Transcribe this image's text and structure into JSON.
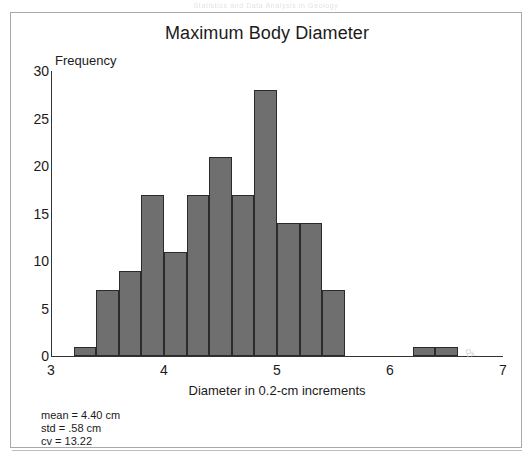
{
  "scan_header": "Statistics and Data Analysis in Geology",
  "chart_data": {
    "type": "bar",
    "title": "Maximum Body Diameter",
    "xlabel": "Diameter in 0.2-cm increments",
    "ylabel": "Frequency",
    "xlim": [
      3,
      7
    ],
    "ylim": [
      0,
      30
    ],
    "grid": false,
    "legend": null,
    "bin_width": 0.2,
    "xticks": [
      "3",
      "4",
      "5",
      "6",
      "7"
    ],
    "xtick_values": [
      3,
      4,
      5,
      6,
      7
    ],
    "yticks": [
      "0",
      "5",
      "10",
      "15",
      "20",
      "25",
      "30"
    ],
    "ytick_values": [
      0,
      5,
      10,
      15,
      20,
      25,
      30
    ],
    "bins": [
      {
        "x0": 3.2,
        "x1": 3.4,
        "value": 1
      },
      {
        "x0": 3.4,
        "x1": 3.6,
        "value": 7
      },
      {
        "x0": 3.6,
        "x1": 3.8,
        "value": 9
      },
      {
        "x0": 3.8,
        "x1": 4.0,
        "value": 17
      },
      {
        "x0": 4.0,
        "x1": 4.2,
        "value": 11
      },
      {
        "x0": 4.2,
        "x1": 4.4,
        "value": 17
      },
      {
        "x0": 4.4,
        "x1": 4.6,
        "value": 21
      },
      {
        "x0": 4.6,
        "x1": 4.8,
        "value": 17
      },
      {
        "x0": 4.8,
        "x1": 5.0,
        "value": 28
      },
      {
        "x0": 5.0,
        "x1": 5.2,
        "value": 14
      },
      {
        "x0": 5.2,
        "x1": 5.4,
        "value": 14
      },
      {
        "x0": 5.4,
        "x1": 5.6,
        "value": 7
      },
      {
        "x0": 6.2,
        "x1": 6.4,
        "value": 1
      },
      {
        "x0": 6.4,
        "x1": 6.6,
        "value": 1
      }
    ],
    "categories": [
      "3.2",
      "3.4",
      "3.6",
      "3.8",
      "4.0",
      "4.2",
      "4.4",
      "4.6",
      "4.8",
      "5.0",
      "5.2",
      "5.4",
      "6.2",
      "6.4"
    ],
    "values": [
      1,
      7,
      9,
      17,
      11,
      17,
      21,
      17,
      28,
      14,
      14,
      7,
      1,
      1
    ],
    "bar_color": "#6f6f6f",
    "bar_edge_color": "#2b2b2b",
    "annotations": [
      "mean = 4.40 cm",
      "std = .58 cm",
      "cv = 13.22"
    ]
  },
  "stats": {
    "mean": "mean = 4.40 cm",
    "std": "std = .58 cm",
    "cv": "cv = 13.22"
  }
}
